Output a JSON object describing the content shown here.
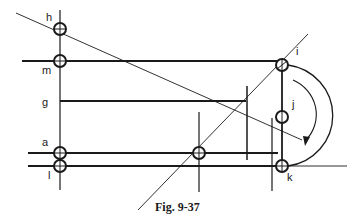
{
  "figure": {
    "caption": "Fig. 9-37",
    "labels": {
      "h": "h",
      "m": "m",
      "g": "g",
      "a": "a",
      "l": "l",
      "i": "i",
      "j": "j",
      "k": "k"
    },
    "colors": {
      "ink": "#1a1a1a",
      "background": "#ffffff"
    }
  }
}
